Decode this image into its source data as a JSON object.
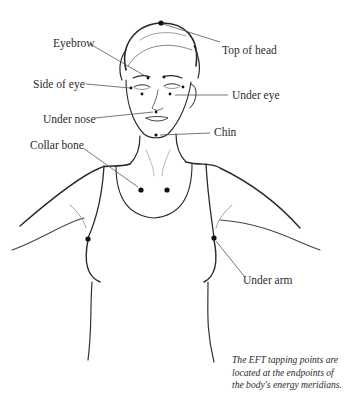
{
  "diagram": {
    "title": "EFT tapping points",
    "labels": {
      "top_of_head": "Top of head",
      "eyebrow": "Eyebrow",
      "side_of_eye": "Side of eye",
      "under_eye": "Under eye",
      "under_nose": "Under nose",
      "chin": "Chin",
      "collar_bone": "Collar bone",
      "under_arm": "Under arm"
    },
    "caption_lines": [
      "The EFT tapping points are",
      "located at the endpoints of",
      "the body's energy meridians."
    ],
    "colors": {
      "ink": "#1a1a1a",
      "line": "#555555",
      "background": "#ffffff"
    }
  }
}
